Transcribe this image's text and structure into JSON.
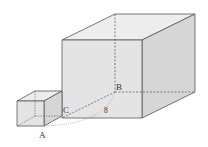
{
  "figure": {
    "type": "geometry-diagram",
    "labels": {
      "A": "A",
      "B": "B",
      "C": "C",
      "length": "8"
    },
    "colors": {
      "edge": "#555555",
      "face_front": "#e4e4e4",
      "face_top": "#ededed",
      "face_side": "#d6d6d6",
      "arc": "#9a9a9a"
    }
  }
}
